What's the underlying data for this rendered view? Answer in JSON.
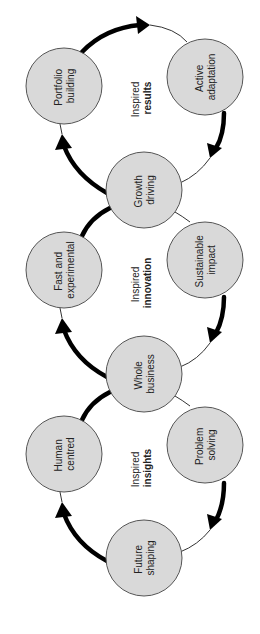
{
  "diagram": {
    "type": "linked-cycles",
    "orientation": "rotated -90deg (text reads bottom-to-top)",
    "colors": {
      "node_fill": "#d9d9d9",
      "node_stroke": "#555555",
      "arrow": "#000000",
      "text": "#222222"
    },
    "cycles": [
      {
        "id": "results",
        "center_label": {
          "line1": "Inspired",
          "line2": "results"
        },
        "nodes": [
          "Portfolio building",
          "Active adaptation",
          "Growth driving"
        ]
      },
      {
        "id": "innovation",
        "center_label": {
          "line1": "Inspired",
          "line2": "innovation"
        },
        "nodes": [
          "Growth driving",
          "Fast and experimental",
          "Sustainable impact",
          "Whole business"
        ]
      },
      {
        "id": "insights",
        "center_label": {
          "line1": "Inspired",
          "line2": "insights"
        },
        "nodes": [
          "Whole business",
          "Human centred",
          "Problem solving",
          "Future shaping"
        ]
      }
    ],
    "nodes": {
      "portfolio": {
        "line1": "Portfolio",
        "line2": "building"
      },
      "active": {
        "line1": "Active",
        "line2": "adaptation"
      },
      "growth": {
        "line1": "Growth",
        "line2": "driving"
      },
      "fast": {
        "line1": "Fast and",
        "line2": "experimental"
      },
      "sustainable": {
        "line1": "Sustainable",
        "line2": "impact"
      },
      "whole": {
        "line1": "Whole",
        "line2": "business"
      },
      "human": {
        "line1": "Human",
        "line2": "centred"
      },
      "problem": {
        "line1": "Problem",
        "line2": "solving"
      },
      "future": {
        "line1": "Future",
        "line2": "shaping"
      }
    },
    "center_labels": {
      "results": {
        "line1": "Inspired",
        "line2": "results"
      },
      "innovation": {
        "line1": "Inspired",
        "line2": "innovation"
      },
      "insights": {
        "line1": "Inspired",
        "line2": "insights"
      }
    }
  }
}
